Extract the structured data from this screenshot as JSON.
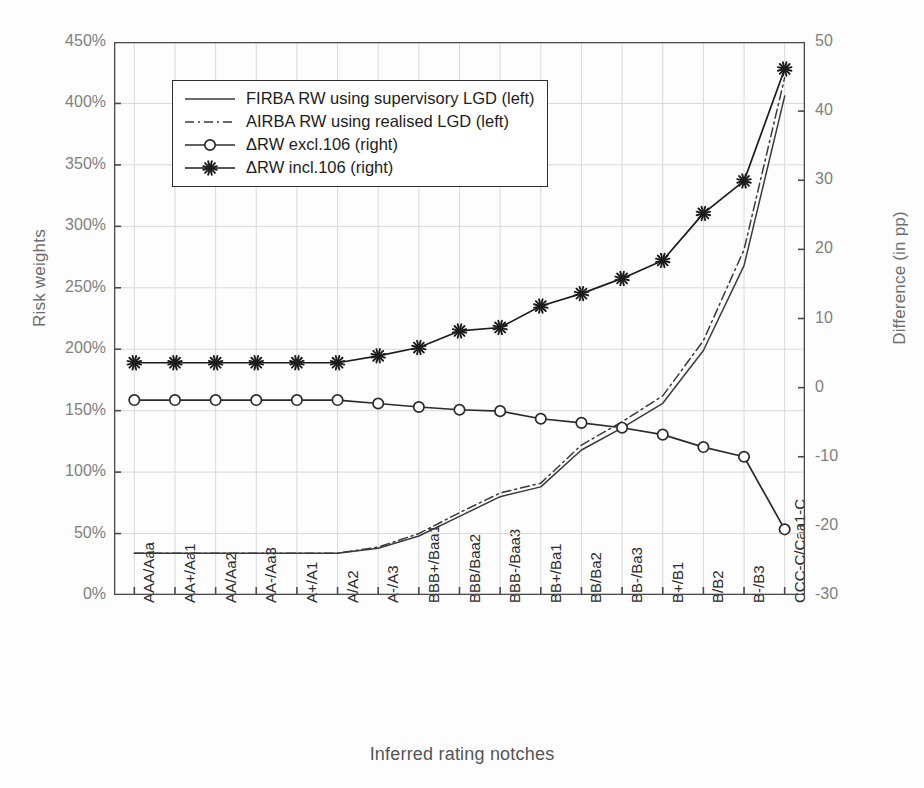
{
  "chart_data": {
    "type": "line",
    "title": "",
    "xlabel": "Inferred rating notches",
    "ylabel": "Risk weights",
    "ylabel_right": "Difference (in pp)",
    "grid": true,
    "legend_position": "upper-left-inside",
    "categories": [
      "AAA/Aaa",
      "AA+/Aa1",
      "AA/Aa2",
      "AA-/Aa3",
      "A+/A1",
      "A/A2",
      "A-/A3",
      "BBB+/Baa1",
      "BBB/Baa2",
      "BBB-/Baa3",
      "BB+/Ba1",
      "BB/Ba2",
      "BB-/Ba3",
      "B+/B1",
      "B/B2",
      "B-/B3",
      "CCC-C/Caa1-C"
    ],
    "ylim": [
      0,
      450
    ],
    "yticks": [
      "0%",
      "50%",
      "100%",
      "150%",
      "200%",
      "250%",
      "300%",
      "350%",
      "400%",
      "450%"
    ],
    "ytick_values": [
      0,
      50,
      100,
      150,
      200,
      250,
      300,
      350,
      400,
      450
    ],
    "ylim_right": [
      -30,
      50
    ],
    "yticks_right": [
      "-30",
      "-20",
      "-10",
      "0",
      "10",
      "20",
      "30",
      "40",
      "50"
    ],
    "ytick_values_right": [
      -30,
      -20,
      -10,
      0,
      10,
      20,
      30,
      40,
      50
    ],
    "series": [
      {
        "name": "FIRBA RW using supervisory LGD (left)",
        "axis": "left",
        "style": "solid",
        "marker": "none",
        "color": "#3a3a3a",
        "values": [
          34,
          34,
          34,
          34,
          34,
          34,
          38,
          48,
          64,
          80,
          88,
          118,
          136,
          156,
          199,
          268,
          406
        ]
      },
      {
        "name": "AIRBA RW using realised LGD (left)",
        "axis": "left",
        "style": "dash-dot",
        "marker": "none",
        "color": "#3a3a3a",
        "values": [
          34,
          34,
          34,
          34,
          34,
          34,
          39,
          50,
          67,
          83,
          91,
          122,
          141,
          162,
          207,
          281,
          421
        ]
      },
      {
        "name": "ΔRW excl.106 (right)",
        "axis": "right",
        "style": "solid",
        "marker": "circle",
        "color": "#2b2b2b",
        "values": [
          -1.8,
          -1.8,
          -1.8,
          -1.8,
          -1.8,
          -1.8,
          -2.3,
          -2.8,
          -3.2,
          -3.4,
          -4.5,
          -5.1,
          -5.8,
          -6.8,
          -8.6,
          -10.0,
          -20.5
        ]
      },
      {
        "name": "ΔRW incl.106 (right)",
        "axis": "right",
        "style": "solid",
        "marker": "star",
        "color": "#1c1c1c",
        "values": [
          3.6,
          3.6,
          3.6,
          3.6,
          3.6,
          3.6,
          4.6,
          5.8,
          8.2,
          8.7,
          11.8,
          13.6,
          15.8,
          18.4,
          25.2,
          29.9,
          46.1
        ]
      }
    ]
  },
  "legend": {
    "items": [
      {
        "label": "FIRBA RW using supervisory LGD (left)",
        "key": "line-solid"
      },
      {
        "label": "AIRBA RW using realised LGD (left)",
        "key": "line-dash-dot"
      },
      {
        "label": "ΔRW excl.106 (right)",
        "key": "line-circle"
      },
      {
        "label": "ΔRW incl.106 (right)",
        "key": "line-star"
      }
    ]
  },
  "colors": {
    "grid": "#d9d9d9",
    "axis": "#4a4a4a",
    "tick_label": "#808080",
    "xtick_label": "#2b2b2b",
    "axis_title": "#6d6d6d",
    "plot_background": "#ffffff"
  }
}
